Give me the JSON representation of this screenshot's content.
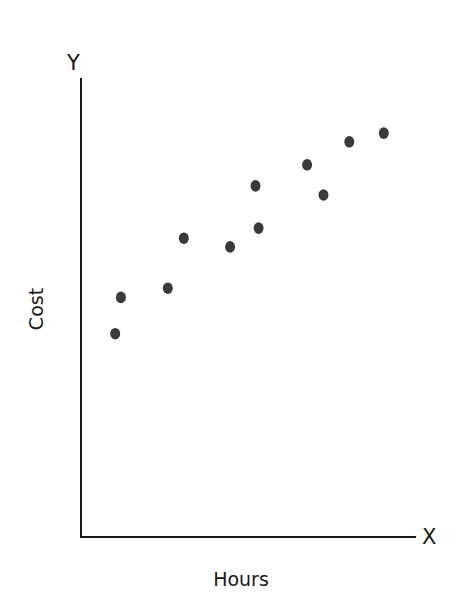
{
  "chart_data": {
    "type": "scatter",
    "title": "",
    "xlabel": "Hours",
    "ylabel": "Cost",
    "x_axis_letter": "X",
    "y_axis_letter": "Y",
    "grid": false,
    "legend": null,
    "ticks": false,
    "xlim": [
      0,
      100
    ],
    "ylim": [
      0,
      100
    ],
    "point_color": "#3a3a3a",
    "axis_color": "#1a1a1a",
    "points": [
      {
        "x": 10.2,
        "y": 44.3
      },
      {
        "x": 11.9,
        "y": 52.2
      },
      {
        "x": 25.9,
        "y": 54.2
      },
      {
        "x": 30.7,
        "y": 65.1
      },
      {
        "x": 44.5,
        "y": 63.2
      },
      {
        "x": 52.1,
        "y": 76.5
      },
      {
        "x": 53.0,
        "y": 67.3
      },
      {
        "x": 67.5,
        "y": 81.1
      },
      {
        "x": 72.4,
        "y": 74.5
      },
      {
        "x": 80.1,
        "y": 86.1
      },
      {
        "x": 90.4,
        "y": 88.0
      }
    ]
  }
}
